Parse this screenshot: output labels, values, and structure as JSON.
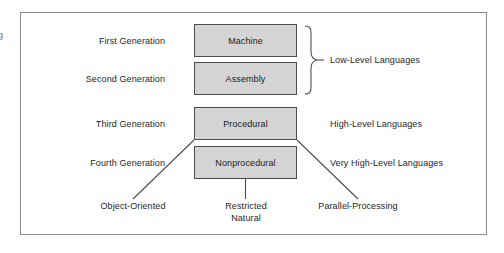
{
  "figure": {
    "margin_glyph": "g",
    "frame": {
      "border_color": "#8a8a8a",
      "background": "#ffffff"
    },
    "box_style": {
      "fill": "#d4d4d4",
      "stroke": "#4d4d4d"
    },
    "line_color": "#4d4d4d"
  },
  "generations": [
    {
      "label": "First Generation",
      "box": "Machine"
    },
    {
      "label": "Second Generation",
      "box": "Assembly"
    },
    {
      "label": "Third Generation",
      "box": "Procedural"
    },
    {
      "label": "Fourth Generation",
      "box": "Nonprocedural"
    }
  ],
  "categories": [
    {
      "label": "Low-Level Languages",
      "spans": [
        "Machine",
        "Assembly"
      ],
      "has_brace": true
    },
    {
      "label": "High-Level Languages",
      "spans": [
        "Procedural"
      ],
      "has_brace": false
    },
    {
      "label": "Very High-Level Languages",
      "spans": [
        "Nonprocedural"
      ],
      "has_brace": false
    }
  ],
  "branches": [
    {
      "label_line1": "Object-Oriented",
      "label_line2": "",
      "connector": "diagonal-left"
    },
    {
      "label_line1": "Restricted",
      "label_line2": "Natural",
      "connector": "vertical"
    },
    {
      "label_line1": "Parallel-Processing",
      "label_line2": "",
      "connector": "diagonal-right"
    }
  ]
}
